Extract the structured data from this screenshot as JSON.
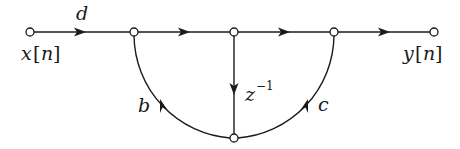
{
  "diagram": {
    "type": "signal-flow-graph",
    "colors": {
      "stroke": "#1a1a1a",
      "background": "#ffffff",
      "node_fill": "#ffffff"
    },
    "nodes": [
      {
        "id": "input",
        "x": 30,
        "y": 32
      },
      {
        "id": "n1",
        "x": 134,
        "y": 32
      },
      {
        "id": "n2",
        "x": 234,
        "y": 32
      },
      {
        "id": "n3",
        "x": 334,
        "y": 32
      },
      {
        "id": "output",
        "x": 434,
        "y": 32
      },
      {
        "id": "n4",
        "x": 234,
        "y": 138
      }
    ],
    "edges": [
      {
        "from": "input",
        "to": "n1",
        "gain": "d"
      },
      {
        "from": "n1",
        "to": "n2",
        "gain": ""
      },
      {
        "from": "n2",
        "to": "n3",
        "gain": ""
      },
      {
        "from": "n3",
        "to": "output",
        "gain": ""
      },
      {
        "from": "n2",
        "to": "n4",
        "gain": "z^-1"
      },
      {
        "from": "n4",
        "to": "n1",
        "gain": "b"
      },
      {
        "from": "n4",
        "to": "n3",
        "gain": "c"
      }
    ],
    "labels": {
      "input_var": "x",
      "input_open": "[",
      "input_idx": "n",
      "input_close": "]",
      "output_var": "y",
      "output_open": "[",
      "output_idx": "n",
      "output_close": "]",
      "gain_d": "d",
      "gain_b": "b",
      "gain_c": "c",
      "delay_base": "z",
      "delay_exp": "−1"
    }
  }
}
